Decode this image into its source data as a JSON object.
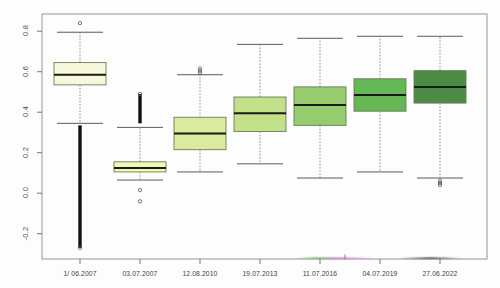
{
  "figure": {
    "title": "",
    "background": "#fdfdfd",
    "frame_color": "#8a8a8a"
  },
  "axes": {
    "y_ticks": [
      "0.8",
      "0.6",
      "0.4",
      "0.2",
      "0.0",
      "-0.2"
    ],
    "y_tick_values": [
      0.8,
      0.6,
      0.4,
      0.2,
      0.0,
      -0.2
    ],
    "x_ticks": [
      "1/ 06.2007",
      "03.07.2007",
      "12.08.2010",
      "19.07.2013",
      "11.07.2016",
      "04.07.2019",
      "27.06.2022"
    ],
    "xlabel": "",
    "ylabel": ""
  },
  "chart_data": {
    "type": "box",
    "title": "",
    "xlabel": "",
    "ylabel": "",
    "ylim": [
      -0.32,
      0.88
    ],
    "grid": false,
    "legend": "none",
    "categories": [
      "1/ 06.2007",
      "03.07.2007",
      "12.08.2010",
      "19.07.2013",
      "11.07.2016",
      "04.07.2019",
      "27.06.2022"
    ],
    "boxes": [
      {
        "label": "1/ 06.2007",
        "fill": "#f7f7dc",
        "whisker_low": 0.345,
        "q1": 0.535,
        "median": 0.585,
        "q3": 0.645,
        "whisker_high": 0.795,
        "outliers_low": [
          0.335,
          0.325,
          0.315,
          0.305,
          0.295,
          0.285,
          0.275,
          0.265,
          0.255,
          0.245,
          0.235,
          0.225,
          0.215,
          0.205,
          0.195,
          0.185,
          0.175,
          0.165,
          0.155,
          -0.27
        ],
        "outliers_high": [
          0.84
        ]
      },
      {
        "label": "03.07.2007",
        "fill": "#f2f7b4",
        "whisker_low": 0.065,
        "q1": 0.105,
        "median": 0.125,
        "q3": 0.155,
        "whisker_high": 0.325,
        "outliers_low": [
          0.015,
          -0.04
        ],
        "outliers_high": [
          0.345,
          0.355,
          0.365,
          0.375,
          0.385,
          0.395,
          0.405,
          0.415,
          0.425,
          0.435,
          0.445,
          0.455,
          0.465,
          0.475,
          0.49
        ]
      },
      {
        "label": "12.08.2010",
        "fill": "#dbeb9c",
        "whisker_low": 0.105,
        "q1": 0.215,
        "median": 0.295,
        "q3": 0.375,
        "whisker_high": 0.585,
        "outliers_low": [],
        "outliers_high": [
          0.595,
          0.605,
          0.615
        ]
      },
      {
        "label": "19.07.2013",
        "fill": "#c3e08a",
        "whisker_low": 0.145,
        "q1": 0.305,
        "median": 0.395,
        "q3": 0.475,
        "whisker_high": 0.735,
        "outliers_low": [],
        "outliers_high": []
      },
      {
        "label": "11.07.2016",
        "fill": "#95cc6e",
        "whisker_low": 0.075,
        "q1": 0.335,
        "median": 0.435,
        "q3": 0.525,
        "whisker_high": 0.765,
        "outliers_low": [],
        "outliers_high": []
      },
      {
        "label": "04.07.2019",
        "fill": "#66b755",
        "whisker_low": 0.105,
        "q1": 0.405,
        "median": 0.485,
        "q3": 0.565,
        "whisker_high": 0.775,
        "outliers_low": [],
        "outliers_high": []
      },
      {
        "label": "27.06.2022",
        "fill": "#4a8c44",
        "whisker_low": 0.075,
        "q1": 0.445,
        "median": 0.525,
        "q3": 0.605,
        "whisker_high": 0.775,
        "outliers_low": [
          0.06,
          0.05,
          0.04
        ],
        "outliers_high": []
      }
    ]
  }
}
